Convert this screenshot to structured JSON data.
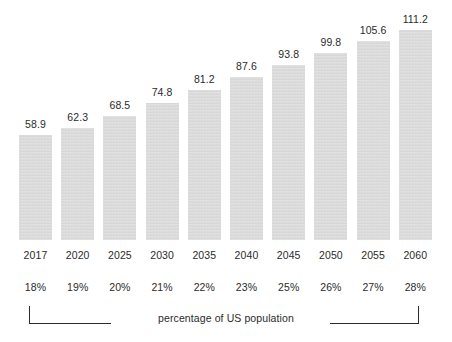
{
  "chart_data": {
    "type": "bar",
    "title": "",
    "subtitle": "",
    "xlabel": "",
    "ylabel": "",
    "categories": [
      "2017",
      "2020",
      "2025",
      "2030",
      "2035",
      "2040",
      "2045",
      "2050",
      "2055",
      "2060"
    ],
    "values": [
      58.9,
      62.3,
      68.5,
      74.8,
      81.2,
      87.6,
      93.8,
      99.8,
      105.6,
      111.2
    ],
    "value_labels": [
      "58.9",
      "62.3",
      "68.5",
      "74.8",
      "81.2",
      "87.6",
      "93.8",
      "99.8",
      "105.6",
      "111.2"
    ],
    "secondary_axis_label": "percentage of US population",
    "secondary_values": [
      "18%",
      "19%",
      "20%",
      "21%",
      "22%",
      "23%",
      "25%",
      "26%",
      "27%",
      "28%"
    ],
    "ylim": [
      0,
      120
    ],
    "grid": false,
    "legend": "none",
    "bar_color": "#d9d9d9",
    "text_color": "#2b2b2b",
    "background_color": "#ffffff"
  },
  "annotations": {
    "caption": "percentage of US population"
  }
}
